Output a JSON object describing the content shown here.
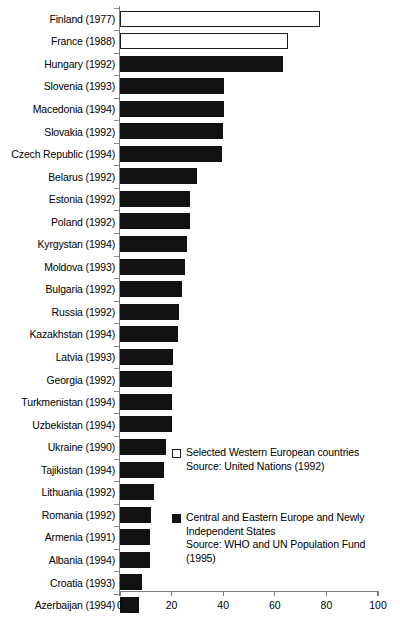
{
  "chart_data": {
    "type": "bar",
    "orientation": "horizontal",
    "title": "",
    "xlabel": "",
    "ylabel": "",
    "xlim": [
      0,
      100
    ],
    "xticks": [
      0,
      20,
      40,
      60,
      80,
      100
    ],
    "grid": false,
    "categories": [
      "Finland (1977)",
      "France (1988)",
      "Hungary (1992)",
      "Slovenia (1993)",
      "Macedonia (1994)",
      "Slovakia (1992)",
      "Czech Republic (1994)",
      "Belarus (1992)",
      "Estonia (1992)",
      "Poland (1992)",
      "Kyrgystan (1994)",
      "Moldova (1993)",
      "Bulgaria (1992)",
      "Russia (1992)",
      "Kazakhstan (1994)",
      "Latvia (1993)",
      "Georgia (1992)",
      "Turkmenistan (1994)",
      "Uzbekistan (1994)",
      "Ukraine (1990)",
      "Tajikistan (1994)",
      "Lithuania (1992)",
      "Romania (1992)",
      "Armenia (1991)",
      "Albania (1994)",
      "Croatia (1993)",
      "Azerbaijan (1994)"
    ],
    "values": [
      77.5,
      65,
      63,
      40.5,
      40.5,
      40,
      39.5,
      30,
      27,
      27,
      26,
      25,
      24,
      23,
      22.5,
      20.5,
      20,
      20,
      20,
      18,
      17,
      13,
      12,
      11.5,
      11.5,
      8.5,
      7.5
    ],
    "series_of_bar": [
      "west",
      "west",
      "cee",
      "cee",
      "cee",
      "cee",
      "cee",
      "cee",
      "cee",
      "cee",
      "cee",
      "cee",
      "cee",
      "cee",
      "cee",
      "cee",
      "cee",
      "cee",
      "cee",
      "cee",
      "cee",
      "cee",
      "cee",
      "cee",
      "cee",
      "cee",
      "cee"
    ],
    "legend": {
      "position": "inside-lower-right",
      "entries": [
        {
          "key": "west",
          "style": "hollow",
          "lines": [
            "Selected Western European countries",
            "Source: United Nations (1992)"
          ]
        },
        {
          "key": "cee",
          "style": "filled",
          "lines": [
            "Central and Eastern Europe and Newly",
            "Independent States",
            "Source: WHO and UN Population Fund",
            "(1995)"
          ]
        }
      ]
    },
    "colors": {
      "filled_bar": "#111111",
      "hollow_bar_fill": "#ffffff",
      "hollow_bar_border": "#1a1a1a",
      "axis": "#7d7d7d",
      "text": "#000000",
      "background": "#ffffff"
    }
  }
}
